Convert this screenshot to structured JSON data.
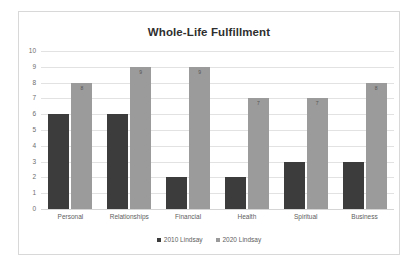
{
  "chart_data": {
    "type": "bar",
    "title": "Whole-Life Fulfillment",
    "xlabel": "",
    "ylabel": "",
    "ylim": [
      0,
      10
    ],
    "ystep": 1,
    "yticks": [
      "10",
      "9",
      "8",
      "7",
      "6",
      "5",
      "4",
      "3",
      "2",
      "1",
      "0"
    ],
    "grid": true,
    "legend_position": "bottom",
    "categories": [
      "Personal",
      "Relationships",
      "Financial",
      "Health",
      "Spiritual",
      "Business"
    ],
    "series": [
      {
        "name": "2010 Lindsay",
        "color": "#3c3c3c",
        "values": [
          6,
          6,
          2,
          2,
          3,
          3
        ],
        "show_labels": false
      },
      {
        "name": "2020 Lindsay",
        "color": "#9b9b9b",
        "values": [
          8,
          9,
          9,
          7,
          7,
          8
        ],
        "show_labels": true
      }
    ]
  },
  "frame": {
    "border_color": "#d8d8d8",
    "background": "#ffffff"
  }
}
